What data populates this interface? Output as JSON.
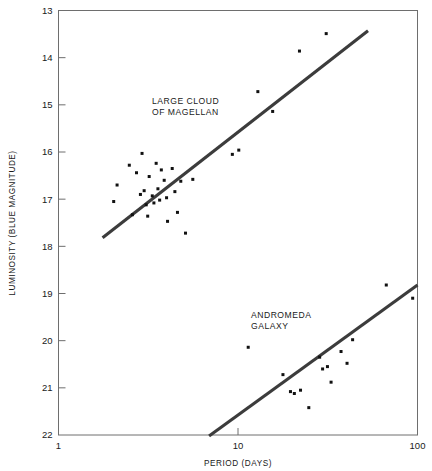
{
  "chart_data": {
    "type": "scatter",
    "title": "",
    "subtitle": "",
    "xlabel": "PERIOD (DAYS)",
    "ylabel": "LUMINOSITY (BLUE MAGNITUDE)",
    "xscale": "log",
    "yscale": "linear",
    "y_inverted": true,
    "xlim": [
      1,
      100
    ],
    "ylim": [
      13,
      22
    ],
    "xticks": [
      1,
      10,
      100
    ],
    "xtick_labels": [
      "1",
      "10",
      "100"
    ],
    "yticks": [
      13,
      14,
      15,
      16,
      17,
      18,
      19,
      20,
      21,
      22
    ],
    "ytick_labels": [
      "13",
      "14",
      "15",
      "16",
      "17",
      "18",
      "19",
      "20",
      "21",
      "22"
    ],
    "grid": false,
    "legend_position": "inline-annotations",
    "annotations": [
      {
        "name": "large-cloud-of-magellan",
        "lines": [
          "LARGE CLOUD",
          "OF MAGELLAN"
        ],
        "x_px": 152,
        "y_px": 104
      },
      {
        "name": "andromeda-galaxy",
        "lines": [
          "ANDROMEDA",
          "GALAXY"
        ],
        "x_px": 251,
        "y_px": 318
      }
    ],
    "series": [
      {
        "name": "LARGE CLOUD OF MAGELLAN",
        "marker": "square-dot",
        "color": "#111111",
        "points": [
          [
            2.03,
            17.05
          ],
          [
            2.12,
            16.7
          ],
          [
            2.48,
            16.28
          ],
          [
            2.58,
            17.33
          ],
          [
            2.72,
            16.44
          ],
          [
            2.86,
            16.9
          ],
          [
            2.92,
            16.03
          ],
          [
            3.0,
            16.82
          ],
          [
            3.08,
            17.12
          ],
          [
            3.14,
            17.36
          ],
          [
            3.2,
            16.52
          ],
          [
            3.33,
            16.93
          ],
          [
            3.4,
            17.08
          ],
          [
            3.5,
            16.24
          ],
          [
            3.58,
            16.78
          ],
          [
            3.66,
            17.02
          ],
          [
            3.74,
            16.38
          ],
          [
            3.88,
            16.6
          ],
          [
            4.0,
            16.97
          ],
          [
            4.05,
            17.47
          ],
          [
            4.3,
            16.35
          ],
          [
            4.45,
            16.84
          ],
          [
            4.6,
            17.28
          ],
          [
            4.8,
            16.62
          ],
          [
            5.1,
            17.72
          ],
          [
            5.6,
            16.58
          ],
          [
            9.3,
            16.05
          ],
          [
            10.1,
            15.96
          ],
          [
            12.9,
            14.72
          ],
          [
            15.6,
            15.14
          ],
          [
            22.0,
            13.86
          ],
          [
            31.0,
            13.49
          ]
        ],
        "trend_line": {
          "x0": 1.76,
          "y0": 17.82,
          "x1": 53.0,
          "y1": 13.43
        }
      },
      {
        "name": "ANDROMEDA GALAXY",
        "marker": "square-dot",
        "color": "#111111",
        "points": [
          [
            11.4,
            20.14
          ],
          [
            17.8,
            20.72
          ],
          [
            19.6,
            21.08
          ],
          [
            20.6,
            21.12
          ],
          [
            22.3,
            21.05
          ],
          [
            24.8,
            21.42
          ],
          [
            28.5,
            20.35
          ],
          [
            29.6,
            20.6
          ],
          [
            31.5,
            20.55
          ],
          [
            33.0,
            20.88
          ],
          [
            37.5,
            20.23
          ],
          [
            40.5,
            20.48
          ],
          [
            43.5,
            19.98
          ],
          [
            67.0,
            18.82
          ],
          [
            94.0,
            19.1
          ]
        ],
        "trend_line": {
          "x0": 6.9,
          "y0": 22.02,
          "x1": 100.0,
          "y1": 18.82
        }
      }
    ]
  }
}
